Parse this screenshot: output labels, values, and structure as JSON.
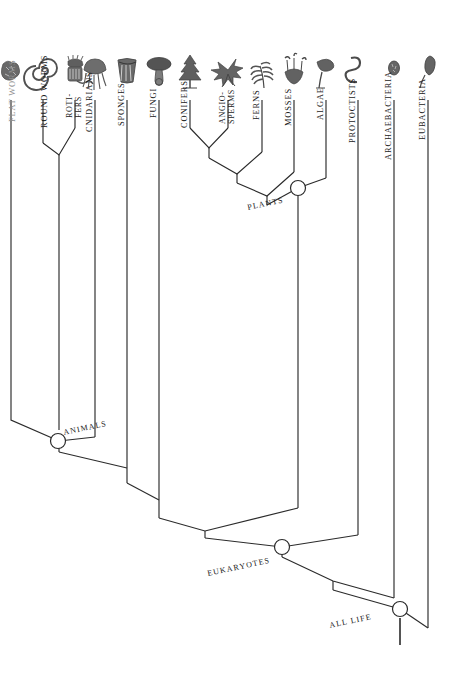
{
  "diagram": {
    "type": "phylogenetic-tree",
    "orientation": "tips-at-top",
    "line_color": "#2b2b2b",
    "background": "#ffffff"
  },
  "tips": [
    {
      "id": "flat-worms",
      "label": "FLAT WORMS",
      "icon": "flatworm-icon",
      "x": 11,
      "label_y": 122,
      "faint": true,
      "lines": [
        {
          "x": 11,
          "y1": 100,
          "y2": 355
        }
      ]
    },
    {
      "id": "round-worms",
      "label": "ROUND WORMS",
      "icon": "roundworm-icon",
      "x": 43,
      "label_y": 128,
      "faint": false,
      "lines": [
        {
          "x": 43,
          "y1": 100,
          "y2": 143
        }
      ]
    },
    {
      "id": "rotifers",
      "label": "ROTI-\nFERS",
      "icon": "rotifer-icon",
      "x": 75,
      "label_y": 120,
      "faint": false,
      "lines": [
        {
          "x": 75,
          "y1": 100,
          "y2": 128
        }
      ]
    },
    {
      "id": "cnidarians",
      "label": "CNIDARIANS",
      "icon": "cnidarian-icon",
      "x": 95,
      "label_y": 128,
      "faint": false,
      "lines": [
        {
          "x": 95,
          "y1": 100,
          "y2": 437
        }
      ]
    },
    {
      "id": "sponges",
      "label": "SPONGES",
      "icon": "sponge-icon",
      "x": 127,
      "label_y": 124,
      "faint": false,
      "lines": [
        {
          "x": 127,
          "y1": 100,
          "y2": 468
        }
      ]
    },
    {
      "id": "fungi",
      "label": "FUNGI",
      "icon": "fungus-icon",
      "x": 159,
      "label_y": 118,
      "faint": false,
      "lines": [
        {
          "x": 159,
          "y1": 100,
          "y2": 500
        }
      ]
    },
    {
      "id": "conifers",
      "label": "CONIFERS",
      "icon": "conifer-icon",
      "x": 190,
      "label_y": 124,
      "faint": false,
      "lines": [
        {
          "x": 190,
          "y1": 100,
          "y2": 128
        }
      ]
    },
    {
      "id": "angiosperms",
      "label": "ANGIO-\nSPERMS",
      "icon": "angiosperm-icon",
      "x": 228,
      "label_y": 120,
      "faint": false,
      "lines": [
        {
          "x": 228,
          "y1": 100,
          "y2": 128
        }
      ]
    },
    {
      "id": "ferns",
      "label": "FERNS",
      "icon": "fern-icon",
      "x": 262,
      "label_y": 118,
      "faint": false,
      "lines": [
        {
          "x": 262,
          "y1": 100,
          "y2": 152
        }
      ]
    },
    {
      "id": "mosses",
      "label": "MOSSES",
      "icon": "moss-icon",
      "x": 294,
      "label_y": 122,
      "faint": false,
      "lines": [
        {
          "x": 294,
          "y1": 100,
          "y2": 172
        }
      ]
    },
    {
      "id": "algae",
      "label": "ALGAE",
      "icon": "alga-icon",
      "x": 326,
      "label_y": 118,
      "faint": false,
      "lines": [
        {
          "x": 326,
          "y1": 100,
          "y2": 178
        }
      ]
    },
    {
      "id": "protoctists",
      "label": "PROTOCTISTS",
      "icon": "protoctist-icon",
      "x": 358,
      "label_y": 130,
      "faint": false,
      "lines": [
        {
          "x": 358,
          "y1": 100,
          "y2": 535
        }
      ]
    },
    {
      "id": "archaebacteria",
      "label": "ARCHAEBACTERIA",
      "icon": "archaebacteria-icon",
      "x": 394,
      "label_y": 134,
      "faint": false,
      "lines": [
        {
          "x": 394,
          "y1": 100,
          "y2": 598
        }
      ]
    },
    {
      "id": "eubacteria",
      "label": "EUBACTERIA",
      "icon": "eubacteria-icon",
      "x": 428,
      "label_y": 128,
      "faint": false,
      "lines": [
        {
          "x": 428,
          "y1": 100,
          "y2": 628
        }
      ]
    }
  ],
  "nodes": [
    {
      "id": "plants",
      "label": "PLANTS",
      "x": 298,
      "y": 188,
      "label_x": 248,
      "label_y": 210,
      "rotation": -12,
      "has_circle": true
    },
    {
      "id": "animals",
      "label": "ANIMALS",
      "x": 58,
      "y": 441,
      "label_x": 64,
      "label_y": 435,
      "rotation": -12,
      "has_circle": true
    },
    {
      "id": "eukaryotes",
      "label": "EUKARYOTES",
      "x": 282,
      "y": 547,
      "label_x": 208,
      "label_y": 576,
      "rotation": -12,
      "has_circle": true
    },
    {
      "id": "all-life",
      "label": "ALL LIFE",
      "x": 400,
      "y": 609,
      "label_x": 330,
      "label_y": 628,
      "rotation": -12,
      "has_circle": true
    }
  ],
  "internal_joins": [
    {
      "id": "roundworm-rotifer-join",
      "apex_x": 59,
      "apex_y": 143
    },
    {
      "id": "conifer-angio-join",
      "apex_x": 209,
      "apex_y": 148
    },
    {
      "id": "seedplant-fern-join",
      "apex_x": 237,
      "apex_y": 165
    },
    {
      "id": "vascular-moss-join",
      "apex_x": 267,
      "apex_y": 183
    },
    {
      "id": "sponge-fungi-join",
      "apex_x": 143,
      "apex_y": 483
    },
    {
      "id": "animalfungi-plant-join",
      "apex_x": 205,
      "apex_y": 518
    }
  ],
  "root": {
    "id": "root-stem",
    "x": 400,
    "y_top": 618,
    "y_bottom": 645
  }
}
